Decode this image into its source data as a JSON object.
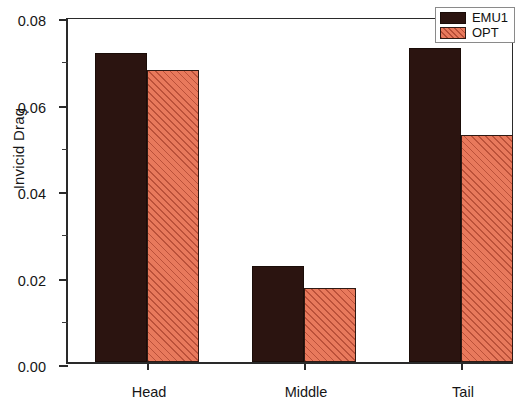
{
  "chart_data": {
    "type": "bar",
    "title": "",
    "xlabel": "",
    "ylabel": "Invicid Drag",
    "categories": [
      "Head",
      "Middle",
      "Tail"
    ],
    "series": [
      {
        "name": "EMU1",
        "color": "#2b1410",
        "values": [
          0.0715,
          0.0222,
          0.0725
        ]
      },
      {
        "name": "OPT",
        "color": "#e8795c",
        "values": [
          0.0675,
          0.017,
          0.0525
        ]
      }
    ],
    "ylim": [
      0.0,
      0.08
    ],
    "ytick_labels": [
      "0.00",
      "0.02",
      "0.04",
      "0.06",
      "0.08"
    ],
    "ytick_values": [
      0.0,
      0.02,
      0.04,
      0.06,
      0.08
    ],
    "yminor_values": [
      0.01,
      0.03,
      0.05,
      0.07
    ],
    "grid": false,
    "legend_position": "top-right",
    "legend_entries": [
      "EMU1",
      "OPT"
    ]
  }
}
